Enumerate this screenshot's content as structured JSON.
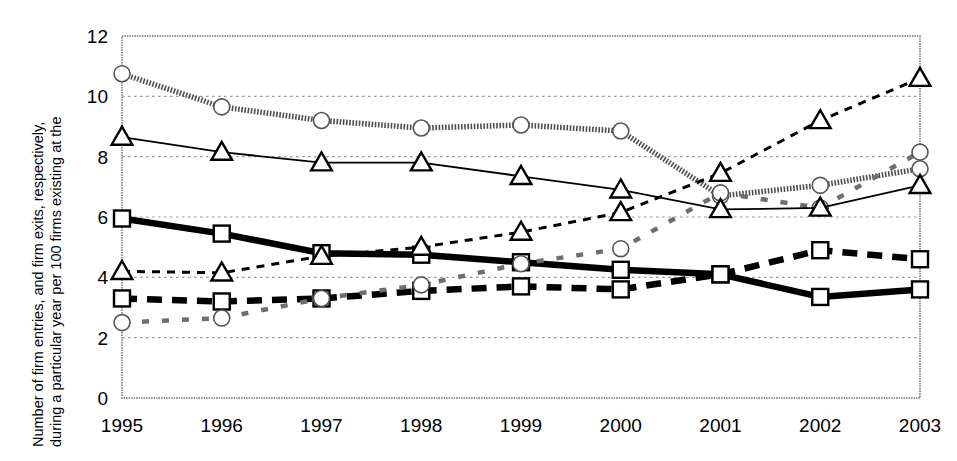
{
  "axis": {
    "ylabel_line1": "Number of firm entries, and firm exits, respectively,",
    "ylabel_line2": "during a particular year per 100 firms existing at the",
    "ylabel_line3": "beginning of this year",
    "ylabel_full": "Number of firm entries, and firm exits, respectively, during a particular year per 100 firms existing at the beginning of this year",
    "yticks": [
      "0",
      "2",
      "4",
      "6",
      "8",
      "10",
      "12"
    ],
    "xticks": [
      "1995",
      "1996",
      "1997",
      "1998",
      "1999",
      "2000",
      "2001",
      "2002",
      "2003"
    ]
  },
  "legend": {
    "items": [
      {
        "label": "Entry rate R&D-int. manuf.",
        "key": "entry_rd"
      },
      {
        "label": "Exit rate R&D-int. manuf.",
        "key": "exit_rd"
      },
      {
        "label": "Entry rate KIBS",
        "key": "entry_kibs"
      },
      {
        "label": "Exit rate KIBS",
        "key": "exit_kibs"
      },
      {
        "label": "Entry rate total",
        "key": "entry_total"
      },
      {
        "label": "Exit rate total",
        "key": "exit_total"
      }
    ]
  },
  "chart_data": {
    "type": "line",
    "title": "",
    "xlabel": "",
    "ylabel": "Number of firm entries, and firm exits, respectively, during a particular year per 100 firms existing at the beginning of this year",
    "categories": [
      "1995",
      "1996",
      "1997",
      "1998",
      "1999",
      "2000",
      "2001",
      "2002",
      "2003"
    ],
    "ylim": [
      0,
      12
    ],
    "ytick_step": 2,
    "grid": true,
    "legend_position": "bottom-center-inside",
    "series": [
      {
        "name": "Entry rate R&D-int. manuf.",
        "key": "entry_rd",
        "marker": "square",
        "line": "thick-solid",
        "color": "#000000",
        "values": [
          5.95,
          5.45,
          4.8,
          4.75,
          4.5,
          4.25,
          4.1,
          3.35,
          3.6
        ]
      },
      {
        "name": "Exit rate R&D-int. manuf.",
        "key": "exit_rd",
        "marker": "square",
        "line": "thick-dashed",
        "color": "#000000",
        "values": [
          3.3,
          3.2,
          3.3,
          3.55,
          3.7,
          3.6,
          4.1,
          4.9,
          4.6
        ]
      },
      {
        "name": "Entry rate KIBS",
        "key": "entry_kibs",
        "marker": "circle",
        "line": "thick-dotted-gray",
        "color": "#808080",
        "values": [
          10.75,
          9.65,
          9.2,
          8.95,
          9.05,
          8.85,
          6.7,
          7.05,
          7.6
        ]
      },
      {
        "name": "Exit rate KIBS",
        "key": "exit_kibs",
        "marker": "circle",
        "line": "sparse-dotted-gray",
        "color": "#808080",
        "values": [
          2.5,
          2.65,
          3.3,
          3.75,
          4.45,
          4.95,
          6.8,
          6.3,
          8.15
        ]
      },
      {
        "name": "Entry rate total",
        "key": "entry_total",
        "marker": "triangle",
        "line": "thin-solid",
        "color": "#000000",
        "values": [
          8.65,
          8.15,
          7.8,
          7.8,
          7.35,
          6.9,
          6.25,
          6.3,
          7.05
        ]
      },
      {
        "name": "Exit rate total",
        "key": "exit_total",
        "marker": "triangle",
        "line": "thin-dashed",
        "color": "#000000",
        "values": [
          4.2,
          4.15,
          4.7,
          5.0,
          5.5,
          6.15,
          7.45,
          9.2,
          10.6
        ]
      }
    ]
  }
}
